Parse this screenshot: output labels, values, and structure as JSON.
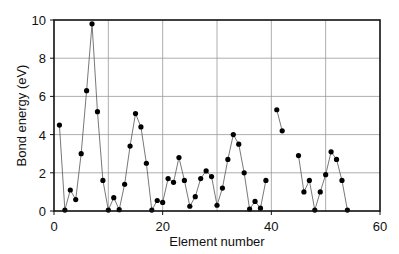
{
  "chart_data": {
    "type": "line",
    "title": "",
    "xlabel": "Element number",
    "ylabel": "Bond energy (eV)",
    "xlim": [
      0,
      60
    ],
    "ylim": [
      0,
      10
    ],
    "xticks": [
      0,
      20,
      40,
      60
    ],
    "yticks": [
      0,
      2,
      4,
      6,
      8,
      10
    ],
    "x_gridlines": [
      10,
      20,
      30,
      40,
      50
    ],
    "y_gridlines": [
      2,
      4,
      6,
      8
    ],
    "grid": true,
    "legend": null,
    "marker": "circle",
    "series": [
      {
        "name": "Bond energy",
        "segments": [
          {
            "x": [
              1,
              2,
              3,
              4,
              5,
              6,
              7,
              8,
              9,
              10,
              11,
              12,
              13,
              14,
              15,
              16,
              17,
              18,
              19,
              20,
              21,
              22,
              23,
              24,
              25,
              26,
              27,
              28,
              29,
              30,
              31,
              32,
              33,
              34,
              35,
              36,
              37,
              38,
              39
            ],
            "y": [
              4.5,
              0.05,
              1.1,
              0.6,
              3.0,
              6.3,
              9.8,
              5.2,
              1.6,
              0.05,
              0.7,
              0.07,
              1.4,
              3.4,
              5.1,
              4.4,
              2.5,
              0.05,
              0.55,
              0.45,
              1.7,
              1.5,
              2.8,
              1.6,
              0.25,
              0.75,
              1.7,
              2.1,
              1.8,
              0.3,
              1.2,
              2.7,
              4.0,
              3.5,
              2.0,
              0.1,
              0.5,
              0.15,
              1.6
            ]
          },
          {
            "x": [
              41,
              42
            ],
            "y": [
              5.3,
              4.2
            ]
          },
          {
            "x": [
              45,
              46,
              47,
              48,
              49,
              50,
              51,
              52,
              53,
              54
            ],
            "y": [
              2.9,
              1.0,
              1.6,
              0.05,
              1.0,
              1.9,
              3.1,
              2.7,
              1.6,
              0.05
            ]
          }
        ]
      }
    ]
  }
}
